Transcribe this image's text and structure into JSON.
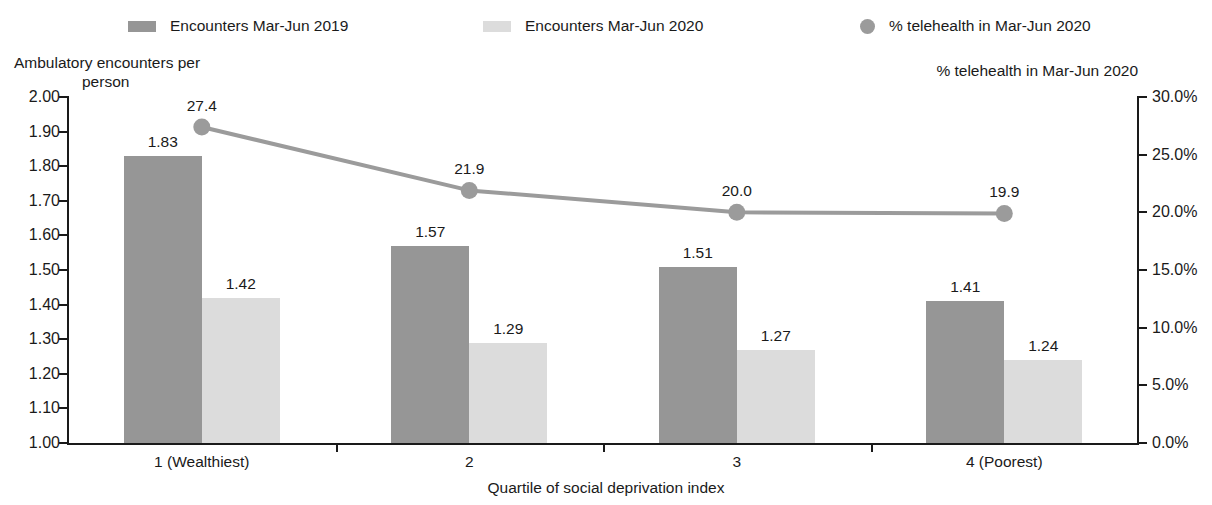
{
  "legend": {
    "items": [
      {
        "label": "Encounters Mar-Jun 2019",
        "marker": "square-swatch-dark",
        "color": "#969696"
      },
      {
        "label": "Encounters Mar-Jun 2020",
        "marker": "square-swatch-light",
        "color": "#dcdcdc"
      },
      {
        "label": "% telehealth in Mar-Jun 2020",
        "marker": "circle-marker",
        "color": "#9b9b9b"
      }
    ]
  },
  "axes": {
    "y_left_title_line1": "Ambulatory encounters per",
    "y_left_title_line2": "person",
    "y_right_title": "% telehealth in Mar-Jun 2020",
    "x_title": "Quartile of social deprivation index",
    "y_left_ticks": [
      "2.00",
      "1.90",
      "1.80",
      "1.70",
      "1.60",
      "1.50",
      "1.40",
      "1.30",
      "1.20",
      "1.10",
      "1.00"
    ],
    "y_right_ticks": [
      "30.0%",
      "25.0%",
      "20.0%",
      "15.0%",
      "10.0%",
      "5.0%",
      "0.0%"
    ]
  },
  "chart_data": {
    "type": "bar",
    "title": "",
    "xlabel": "Quartile of social deprivation index",
    "ylabel": "Ambulatory encounters per person",
    "y2label": "% telehealth in Mar-Jun 2020",
    "categories": [
      "1 (Wealthiest)",
      "2",
      "3",
      "4 (Poorest)"
    ],
    "ylim": [
      1.0,
      2.0
    ],
    "y2lim": [
      0.0,
      30.0
    ],
    "grid": false,
    "legend_position": "top",
    "series": [
      {
        "name": "Encounters Mar-Jun 2019",
        "type": "bar",
        "axis": "left",
        "color": "#969696",
        "values": [
          1.83,
          1.57,
          1.51,
          1.41
        ],
        "labels": [
          "1.83",
          "1.57",
          "1.51",
          "1.41"
        ]
      },
      {
        "name": "Encounters Mar-Jun 2020",
        "type": "bar",
        "axis": "left",
        "color": "#dcdcdc",
        "values": [
          1.42,
          1.29,
          1.27,
          1.24
        ],
        "labels": [
          "1.42",
          "1.29",
          "1.27",
          "1.24"
        ]
      },
      {
        "name": "% telehealth in Mar-Jun 2020",
        "type": "line",
        "axis": "right",
        "color": "#9b9b9b",
        "values": [
          27.4,
          21.9,
          20.0,
          19.9
        ],
        "labels": [
          "27.4",
          "21.9",
          "20.0",
          "19.9"
        ]
      }
    ]
  }
}
